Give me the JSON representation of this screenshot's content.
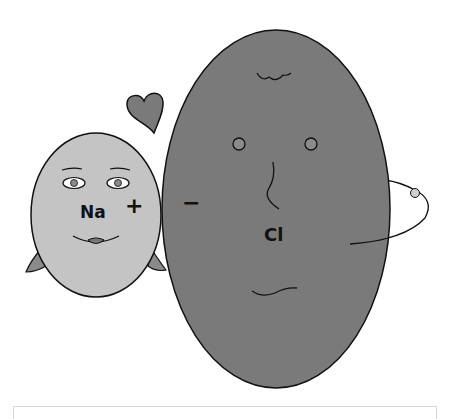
{
  "figure": {
    "type": "illustration",
    "colors": {
      "background": "#ffffff",
      "sodium_face": "#c4c4c4",
      "chloride_face": "#7a7a7a",
      "heart": "#7a7a7a",
      "hair": "#8a8a8a",
      "outline": "#111111",
      "electron": "#cfcfcf",
      "caption_border": "#d8d8d8"
    },
    "sodium": {
      "symbol": "Na",
      "charge": "+"
    },
    "chloride": {
      "symbol": "Cl",
      "charge": "−"
    },
    "decorations": {
      "heart": "heart-icon",
      "electron": "electron-dot"
    }
  }
}
